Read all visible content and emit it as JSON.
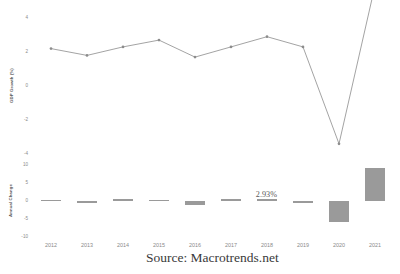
{
  "source_caption": "Source: Macrotrends.net",
  "chart_data": [
    {
      "type": "line",
      "title": "",
      "xlabel": "",
      "ylabel": "GDP Growth (%)",
      "x": [
        2012,
        2013,
        2014,
        2015,
        2016,
        2017,
        2018,
        2019,
        2020,
        2021
      ],
      "categories": [
        "2012",
        "2013",
        "2014",
        "2015",
        "2016",
        "2017",
        "2018",
        "2019",
        "2020",
        "2021"
      ],
      "values": [
        2.2,
        1.8,
        2.3,
        2.7,
        1.7,
        2.3,
        2.9,
        2.3,
        -3.4,
        5.9
      ],
      "ylim": [
        -4,
        4
      ],
      "yticks": [
        4,
        2,
        0,
        -2,
        -4
      ],
      "ytick_labels": [
        "4",
        "2",
        "0",
        "-2",
        "-4"
      ],
      "grid": false,
      "marker": "circle",
      "line_color": "#8c8c8c",
      "marker_color": "#8c8c8c"
    },
    {
      "type": "bar",
      "title": "",
      "xlabel": "",
      "ylabel": "Annual Change",
      "categories": [
        "2012",
        "2013",
        "2014",
        "2015",
        "2016",
        "2017",
        "2018",
        "2019",
        "2020",
        "2021"
      ],
      "values": [
        0.4,
        -0.4,
        0.5,
        0.4,
        -1.0,
        0.6,
        0.6,
        -0.6,
        -5.7,
        9.3
      ],
      "ylim": [
        -10,
        10
      ],
      "yticks": [
        10,
        5,
        0,
        -5,
        -10
      ],
      "ytick_labels": [
        "10",
        "5",
        "0",
        "-5",
        "-10"
      ],
      "grid": false,
      "bar_color": "#9a9a9a",
      "annotations": [
        {
          "label": "2.93%",
          "category": "2018"
        }
      ]
    }
  ]
}
